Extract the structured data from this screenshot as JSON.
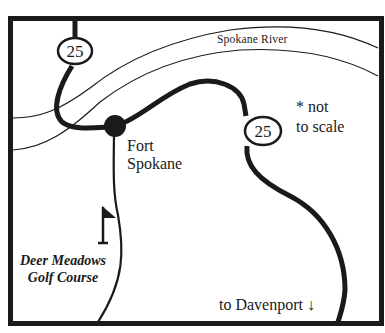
{
  "map": {
    "river_label": "Spokane River",
    "town_label_line1": "Fort",
    "town_label_line2": "Spokane",
    "scale_note_line1": "* not",
    "scale_note_line2": "to scale",
    "golf_label_line1": "Deer Meadows",
    "golf_label_line2": "Golf Course",
    "direction_label": "to Davenport ↓",
    "highway_shields": [
      {
        "route": "25",
        "position": "top-left"
      },
      {
        "route": "25",
        "position": "right"
      }
    ],
    "icons": [
      "highway-shield-icon",
      "town-dot-icon",
      "golf-flag-icon",
      "down-arrow-icon"
    ],
    "colors": {
      "ink": "#1a1a1a",
      "background": "#ffffff"
    }
  }
}
